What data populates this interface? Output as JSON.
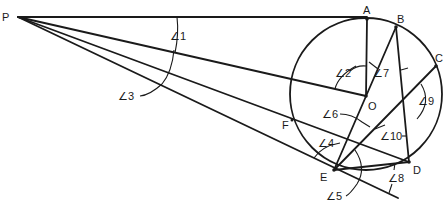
{
  "diagram": {
    "type": "geometry",
    "points": {
      "P": {
        "label": "P",
        "x": 18,
        "y": 17
      },
      "A": {
        "label": "A",
        "x": 367,
        "y": 19
      },
      "B": {
        "label": "B",
        "x": 396,
        "y": 27
      },
      "C": {
        "label": "C",
        "x": 436,
        "y": 66
      },
      "O": {
        "label": "O",
        "x": 366,
        "y": 96
      },
      "D": {
        "label": "D",
        "x": 409,
        "y": 162
      },
      "E": {
        "label": "E",
        "x": 334,
        "y": 170
      },
      "F": {
        "label": "F",
        "x": 292,
        "y": 120
      }
    },
    "circle": {
      "center": "O",
      "cx": 366,
      "cy": 94,
      "r": 76
    },
    "angles": [
      {
        "id": "1",
        "label": "∠1"
      },
      {
        "id": "2",
        "label": "∠2"
      },
      {
        "id": "3",
        "label": "∠3"
      },
      {
        "id": "4",
        "label": "∠4"
      },
      {
        "id": "5",
        "label": "∠5"
      },
      {
        "id": "6",
        "label": "∠6"
      },
      {
        "id": "7",
        "label": "∠7"
      },
      {
        "id": "8",
        "label": "∠8"
      },
      {
        "id": "9",
        "label": "∠9"
      },
      {
        "id": "10",
        "label": "∠10"
      }
    ]
  }
}
